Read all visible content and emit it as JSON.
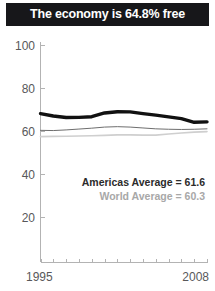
{
  "title": {
    "text": "The economy is 64.8% free"
  },
  "legend": {
    "americas": "Americas Average = 61.6",
    "world": "World Average = 60.3"
  },
  "colors": {
    "title_bar_bg": "#17171a",
    "title_text": "#ffffff",
    "country_line": "#111111",
    "americas_line": "#6e6e6e",
    "world_line": "#cfcfcf",
    "axis": "#b3b3b3",
    "tick_text": "#58585a",
    "legend_primary_text": "#2b2b2b",
    "legend_secondary_text": "#a8a8a8"
  },
  "chart_data": {
    "type": "line",
    "title": "The economy is 64.8% free",
    "xlabel": "",
    "ylabel": "",
    "xlim": [
      1995,
      2008
    ],
    "ylim": [
      0,
      100
    ],
    "yticks": [
      20,
      40,
      60,
      80,
      100
    ],
    "xticks": [
      1995,
      2008
    ],
    "xtick_labels": [
      "1995",
      "2008"
    ],
    "grid": false,
    "legend_position": "inside-bottom-right",
    "x": [
      1995,
      1996,
      1997,
      1998,
      1999,
      2000,
      2001,
      2002,
      2003,
      2004,
      2005,
      2006,
      2007,
      2008
    ],
    "series": [
      {
        "name": "Country",
        "color": "#111111",
        "width": 3.4,
        "values": [
          68.6,
          67.5,
          66.8,
          66.9,
          67.2,
          68.9,
          69.5,
          69.4,
          68.6,
          67.9,
          67.1,
          66.3,
          64.6,
          64.8
        ]
      },
      {
        "name": "Americas Average",
        "color": "#6e6e6e",
        "width": 1.0,
        "values": [
          60.9,
          60.8,
          61.1,
          61.5,
          61.9,
          62.4,
          62.6,
          62.4,
          62.0,
          61.6,
          61.4,
          61.3,
          61.4,
          61.6
        ]
      },
      {
        "name": "World Average",
        "color": "#cfcfcf",
        "width": 1.6,
        "values": [
          58.0,
          58.1,
          58.2,
          58.3,
          58.4,
          58.6,
          58.8,
          58.8,
          58.7,
          58.7,
          59.2,
          59.7,
          60.1,
          60.3
        ]
      }
    ]
  }
}
